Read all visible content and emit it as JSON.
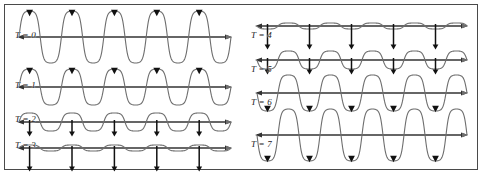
{
  "figure": {
    "border_color": "#4a4a4a",
    "background": "#ffffff",
    "wave_color": "#6e6e6e",
    "axis_color": "#333333",
    "arrow_color": "#111111",
    "width": 482,
    "height": 174
  },
  "chart_data": {
    "type": "line",
    "xlabel": "",
    "ylabel": "",
    "xlim": [
      0,
      1
    ],
    "ylim": [
      -1,
      1
    ],
    "grid": false,
    "legend": "none",
    "cycles": 5,
    "series": [
      {
        "name": "T = 0",
        "phase_amplitude": 1.0,
        "polarity": "positive",
        "arrow_kind": "triangle",
        "arrow_len": 0.0,
        "arrow_at": "crest"
      },
      {
        "name": "T = 1",
        "phase_amplitude": 0.72,
        "polarity": "positive",
        "arrow_kind": "triangle",
        "arrow_len": 0.0,
        "arrow_at": "crest"
      },
      {
        "name": "T = 2",
        "phase_amplitude": 0.34,
        "polarity": "positive",
        "arrow_kind": "line",
        "arrow_len": 0.28,
        "arrow_at": "axis"
      },
      {
        "name": "T = 3",
        "phase_amplitude": 0.1,
        "polarity": "positive",
        "arrow_kind": "line",
        "arrow_len": 0.6,
        "arrow_at": "axis"
      },
      {
        "name": "T = 4",
        "phase_amplitude": 0.1,
        "polarity": "negative",
        "arrow_kind": "line",
        "arrow_len": 0.6,
        "arrow_at": "axis"
      },
      {
        "name": "T = 5",
        "phase_amplitude": 0.34,
        "polarity": "negative",
        "arrow_kind": "line",
        "arrow_len": 0.28,
        "arrow_at": "axis"
      },
      {
        "name": "T = 6",
        "phase_amplitude": 0.72,
        "polarity": "negative",
        "arrow_kind": "triangle",
        "arrow_len": 0.0,
        "arrow_at": "trough"
      },
      {
        "name": "T = 7",
        "phase_amplitude": 1.0,
        "polarity": "negative",
        "arrow_kind": "triangle",
        "arrow_len": 0.0,
        "arrow_at": "trough"
      }
    ]
  },
  "panels": {
    "left": {
      "rows": [
        {
          "label": "T = 0",
          "label_x": 10,
          "label_y": 26,
          "axis_y": 32,
          "amp": 26,
          "sign": 1,
          "arrow": "triangle",
          "arrow_len": 0,
          "arrow_side": "crest"
        },
        {
          "label": "T = 1",
          "label_x": 10,
          "label_y": 76,
          "axis_y": 82,
          "amp": 18,
          "sign": 1,
          "arrow": "triangle",
          "arrow_len": 0,
          "arrow_side": "crest"
        },
        {
          "label": "T = 2",
          "label_x": 10,
          "label_y": 110,
          "axis_y": 117,
          "amp": 9,
          "sign": 1,
          "arrow": "line",
          "arrow_len": 13,
          "arrow_side": "axis"
        },
        {
          "label": "T = 3",
          "label_x": 10,
          "label_y": 136,
          "axis_y": 143,
          "amp": 3,
          "sign": 1,
          "arrow": "line",
          "arrow_len": 22,
          "arrow_side": "axis"
        }
      ]
    },
    "right": {
      "rows": [
        {
          "label": "T = 4",
          "label_x": 8,
          "label_y": 26,
          "axis_y": 21,
          "amp": 3,
          "sign": -1,
          "arrow": "line",
          "arrow_len": 22,
          "arrow_side": "axis"
        },
        {
          "label": "T = 5",
          "label_x": 8,
          "label_y": 60,
          "axis_y": 55,
          "amp": 9,
          "sign": -1,
          "arrow": "line",
          "arrow_len": 13,
          "arrow_side": "axis"
        },
        {
          "label": "T = 6",
          "label_x": 8,
          "label_y": 93,
          "axis_y": 88,
          "amp": 18,
          "sign": -1,
          "arrow": "triangle",
          "arrow_len": 0,
          "arrow_side": "trough"
        },
        {
          "label": "T = 7",
          "label_x": 8,
          "label_y": 135,
          "axis_y": 130,
          "amp": 26,
          "sign": -1,
          "arrow": "triangle",
          "arrow_len": 0,
          "arrow_side": "trough"
        }
      ]
    }
  }
}
